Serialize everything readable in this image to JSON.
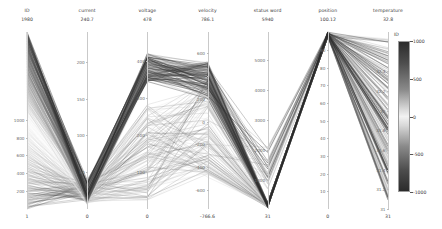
{
  "chart_data": {
    "type": "parallel-coordinates",
    "title": "",
    "grid": false,
    "legend_position": "right",
    "colorbar": {
      "label": "ID",
      "ticks": [
        "1000",
        "500",
        "0",
        "-500",
        "-1000"
      ],
      "tick_values": [
        1000,
        500,
        0,
        -500,
        -1000
      ],
      "vmin": -1000,
      "vmax": 1000,
      "colormap": "gray-diverging"
    },
    "axes": [
      {
        "name": "ID",
        "top_value": "1980",
        "bottom_value": "1",
        "ticks": [
          "1000",
          "800",
          "600",
          "400",
          "200"
        ],
        "tick_values": [
          1000,
          800,
          600,
          400,
          200
        ],
        "range": [
          1,
          1980
        ]
      },
      {
        "name": "current",
        "top_value": "240.7",
        "bottom_value": "0",
        "ticks": [
          "200",
          "150",
          "100",
          "50"
        ],
        "tick_values": [
          200,
          150,
          100,
          50
        ],
        "range": [
          0,
          240.7
        ]
      },
      {
        "name": "voltage",
        "top_value": "478",
        "bottom_value": "0",
        "ticks": [
          "400",
          "300",
          "200",
          "100"
        ],
        "tick_values": [
          400,
          300,
          200,
          100
        ],
        "range": [
          0,
          478
        ]
      },
      {
        "name": "velocity",
        "top_value": "786.1",
        "bottom_value": "-766.6",
        "ticks": [
          "600",
          "400",
          "200",
          "0",
          "-200",
          "-400",
          "-600"
        ],
        "tick_values": [
          600,
          400,
          200,
          0,
          -200,
          -400,
          -600
        ],
        "range": [
          -766.6,
          786.1
        ]
      },
      {
        "name": "status word",
        "top_value": "5940",
        "bottom_value": "31",
        "ticks": [
          "5000",
          "4000",
          "3000",
          "2000",
          "1000"
        ],
        "tick_values": [
          5000,
          4000,
          3000,
          2000,
          1000
        ],
        "range": [
          31,
          5940
        ]
      },
      {
        "name": "position",
        "top_value": "100.12",
        "bottom_value": "0",
        "ticks": [
          "90",
          "80",
          "70",
          "60",
          "50",
          "40",
          "30",
          "20",
          "10"
        ],
        "tick_values": [
          90,
          80,
          70,
          60,
          50,
          40,
          30,
          20,
          10
        ],
        "range": [
          0,
          100.12
        ]
      },
      {
        "name": "temperature",
        "top_value": "32.8",
        "bottom_value": "31",
        "ticks": [
          "32.4",
          "32.2",
          "32",
          "31.8",
          "31.6",
          "31.4",
          "31.2",
          "31"
        ],
        "tick_values": [
          32.4,
          32.2,
          32,
          31.8,
          31.6,
          31.4,
          31.2,
          31
        ],
        "range": [
          31,
          32.8
        ]
      }
    ],
    "xlabel": "",
    "ylabel": "",
    "series_count": 240,
    "series_note": "Each polyline is one record colored by ID"
  },
  "colors": {
    "axis_line": "#c9c9c9",
    "text": "#3a3a3a",
    "tick_text": "#6b6b6b",
    "background": "#ffffff"
  }
}
